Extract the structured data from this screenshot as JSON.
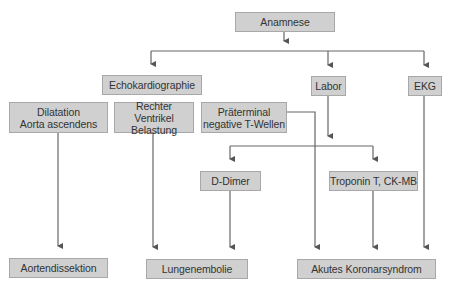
{
  "diagram": {
    "type": "flowchart",
    "colors": {
      "box_fill": "#d0d0d0",
      "box_border": "#a8a8a8",
      "line": "#555555",
      "text": "#333333"
    },
    "nodes": {
      "anamnese": {
        "label": "Anamnese"
      },
      "echo": {
        "label": "Echokardiographie"
      },
      "labor": {
        "label": "Labor"
      },
      "ekg": {
        "label": "EKG"
      },
      "dilatation": {
        "line1": "Dilatation",
        "line2": "Aorta ascendens"
      },
      "rechter": {
        "line1": "Rechter Ventrikel",
        "line2": "Belastung"
      },
      "praeterminal": {
        "line1": "Präterminal",
        "line2": "negative T-Wellen"
      },
      "ddimer": {
        "label": "D-Dimer"
      },
      "troponin": {
        "label": "Troponin T, CK-MB"
      },
      "aortendissektion": {
        "label": "Aortendissektion"
      },
      "lungenembolie": {
        "label": "Lungenembolie"
      },
      "akutes": {
        "label": "Akutes Koronarsyndrom"
      }
    },
    "edges": [
      [
        "Anamnese",
        "Echokardiographie"
      ],
      [
        "Anamnese",
        "Labor"
      ],
      [
        "Anamnese",
        "EKG"
      ],
      [
        "Labor",
        "D-Dimer"
      ],
      [
        "Labor",
        "Troponin T, CK-MB"
      ],
      [
        "Dilatation Aorta ascendens",
        "Aortendissektion"
      ],
      [
        "Rechter Ventrikel Belastung",
        "Lungenembolie"
      ],
      [
        "D-Dimer",
        "Lungenembolie"
      ],
      [
        "Präterminal negative T-Wellen",
        "Akutes Koronarsyndrom"
      ],
      [
        "Troponin T, CK-MB",
        "Akutes Koronarsyndrom"
      ],
      [
        "EKG",
        "Akutes Koronarsyndrom"
      ]
    ]
  }
}
